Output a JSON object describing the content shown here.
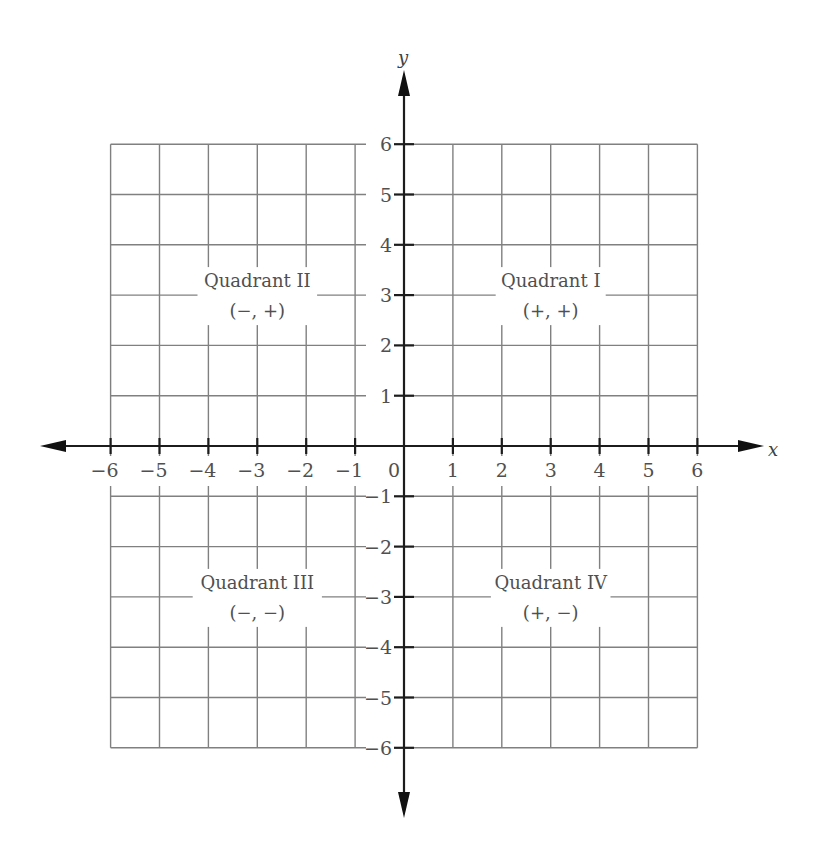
{
  "diagram": {
    "type": "coordinate-plane",
    "x_axis": {
      "label": "x",
      "min": -6,
      "max": 6,
      "tick_labels": [
        "−6",
        "−5",
        "−4",
        "−3",
        "−2",
        "−1",
        "0",
        "1",
        "2",
        "3",
        "4",
        "5",
        "6"
      ]
    },
    "y_axis": {
      "label": "y",
      "min": -6,
      "max": 6,
      "tick_labels": [
        "6",
        "5",
        "4",
        "3",
        "2",
        "1",
        "−1",
        "−2",
        "−3",
        "−4",
        "−5",
        "−6"
      ]
    },
    "origin_label": "0",
    "quadrants": [
      {
        "id": "I",
        "name": "Quadrant I",
        "signs": "(+, +)",
        "center": [
          3,
          3
        ]
      },
      {
        "id": "II",
        "name": "Quadrant II",
        "signs": "(−, +)",
        "center": [
          -3,
          3
        ]
      },
      {
        "id": "III",
        "name": "Quadrant III",
        "signs": "(−, −)",
        "center": [
          -3,
          -3
        ]
      },
      {
        "id": "IV",
        "name": "Quadrant IV",
        "signs": "(+, −)",
        "center": [
          3,
          -3
        ]
      }
    ]
  }
}
